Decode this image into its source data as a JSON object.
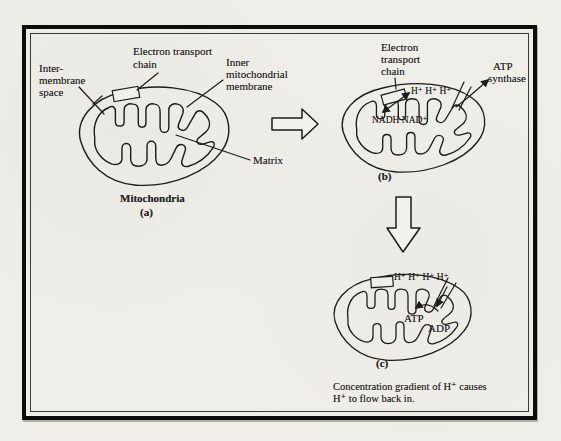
{
  "figure": {
    "type": "textbook-diagram"
  },
  "colors": {
    "paper": "#efeee9",
    "ink": "#1c1c1c",
    "frame": "#0d0d0d"
  },
  "panel_a": {
    "etc_line1": "Electron transport",
    "etc_line2": "chain",
    "intermembrane_line1": "Inter-",
    "intermembrane_line2": "membrane",
    "intermembrane_line3": "space",
    "inner_line1": "Inner",
    "inner_line2": "mitochondrial",
    "inner_line3": "membrane",
    "matrix": "Matrix",
    "title": "Mitochondria",
    "tag": "(a)"
  },
  "panel_b": {
    "etc_line1": "Electron",
    "etc_line2": "transport",
    "etc_line3": "chain",
    "atp_line1": "ATP",
    "atp_line2": "synthase",
    "h_ions": "H⁺ H⁺ H⁺",
    "nadh": "NADH NAD⁺",
    "tag": "(b)"
  },
  "panel_c": {
    "h_ions": "H⁺ H⁺ H⁺ H⁺",
    "atp": "ATP",
    "adp": "ADP",
    "tag": "(c)",
    "caption_line1": "Concentration gradient of H⁺ causes",
    "caption_line2": "H⁺ to flow back in."
  }
}
